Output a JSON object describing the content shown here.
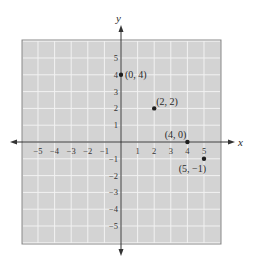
{
  "chart_data": {
    "type": "scatter",
    "title": "",
    "xlabel": "x",
    "ylabel": "y",
    "xlim": [
      -6,
      6
    ],
    "ylim": [
      -6,
      6
    ],
    "grid": true,
    "x_ticks": [
      -5,
      -4,
      -3,
      -2,
      -1,
      1,
      2,
      3,
      4,
      5
    ],
    "y_ticks": [
      5,
      4,
      3,
      2,
      1,
      -1,
      -2,
      -3,
      -4,
      -5
    ],
    "x_tick_labels": [
      "−5",
      "−4",
      "−3",
      "−2",
      "−1",
      "1",
      "2",
      "3",
      "4",
      "5"
    ],
    "y_tick_labels": [
      "5",
      "4",
      "3",
      "2",
      "1",
      "−1",
      "−2",
      "−3",
      "−4",
      "−5"
    ],
    "points": [
      {
        "x": 0,
        "y": 4,
        "label": "(0, 4)"
      },
      {
        "x": 2,
        "y": 2,
        "label": "(2, 2)"
      },
      {
        "x": 4,
        "y": 0,
        "label": "(4, 0)"
      },
      {
        "x": 5,
        "y": -1,
        "label": "(5, −1)"
      }
    ]
  },
  "colors": {
    "grid_background": "#d3d3d3",
    "grid_lines": "#f2f2f2",
    "border": "#8a8a8a",
    "axis": "#333333",
    "point": "#1e1e1e"
  }
}
